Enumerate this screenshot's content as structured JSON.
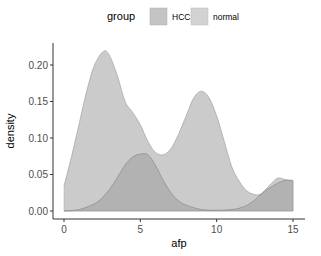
{
  "chart_data": {
    "type": "area",
    "subtype": "density",
    "title": "",
    "xlabel": "afp",
    "ylabel": "density",
    "xlim": [
      0,
      15
    ],
    "ylim": [
      0,
      0.22
    ],
    "x_ticks": [
      0,
      5,
      10,
      15
    ],
    "x_tick_labels": [
      "0",
      "5",
      "10",
      "15"
    ],
    "y_ticks": [
      0.0,
      0.05,
      0.1,
      0.15,
      0.2
    ],
    "y_tick_labels": [
      "0.00",
      "0.05",
      "0.10",
      "0.15",
      "0.20"
    ],
    "grid": false,
    "legend": {
      "title": "group",
      "position": "top",
      "entries": [
        "HCC",
        "normal"
      ]
    },
    "series": [
      {
        "name": "normal",
        "color": "#c8c8c8",
        "stroke": "#a8a8a8",
        "x": [
          0,
          0.5,
          1,
          1.5,
          2,
          2.6,
          3,
          3.5,
          4,
          4.5,
          5,
          5.5,
          6,
          6.5,
          7,
          7.5,
          8,
          8.5,
          9,
          9.5,
          10,
          10.5,
          11,
          11.5,
          12,
          12.6,
          13,
          13.5,
          14,
          14.5,
          15
        ],
        "values": [
          0.034,
          0.075,
          0.12,
          0.165,
          0.2,
          0.219,
          0.212,
          0.185,
          0.15,
          0.135,
          0.118,
          0.095,
          0.08,
          0.077,
          0.085,
          0.105,
          0.13,
          0.155,
          0.164,
          0.155,
          0.13,
          0.095,
          0.06,
          0.04,
          0.027,
          0.022,
          0.025,
          0.036,
          0.045,
          0.043,
          0.04
        ]
      },
      {
        "name": "HCC",
        "color": "#a9a9a9",
        "stroke": "#8f8f8f",
        "x": [
          0,
          1,
          2,
          2.5,
          3,
          3.5,
          4,
          4.5,
          5,
          5.5,
          6,
          6.5,
          7,
          7.5,
          8,
          9,
          10,
          11,
          11.5,
          12,
          12.5,
          13,
          13.5,
          14,
          14.5,
          15
        ],
        "values": [
          0.0,
          0.002,
          0.01,
          0.018,
          0.03,
          0.046,
          0.063,
          0.074,
          0.078,
          0.077,
          0.062,
          0.042,
          0.025,
          0.014,
          0.008,
          0.002,
          0.001,
          0.002,
          0.004,
          0.008,
          0.015,
          0.025,
          0.032,
          0.038,
          0.042,
          0.042
        ]
      }
    ]
  },
  "legend": {
    "title": "group",
    "items": [
      {
        "label": "HCC",
        "color": "#c4c4c4"
      },
      {
        "label": "normal",
        "color": "#d2d2d2"
      }
    ]
  },
  "axes": {
    "xlabel": "afp",
    "ylabel": "density"
  }
}
